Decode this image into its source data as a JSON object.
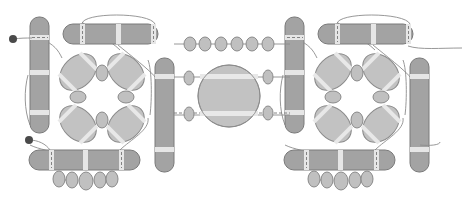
{
  "diagram": {
    "title": "",
    "colors": {
      "bar": "#a3a3a3",
      "band": "#e6e6e6",
      "lobe": "#c2c2c2",
      "bead": "#c0c0c0",
      "wire": "#8c8c8c",
      "terminal_dot": "#4a4a4a"
    },
    "modules": [
      {
        "name": "left-module",
        "side": "left"
      },
      {
        "name": "right-module",
        "side": "right"
      }
    ],
    "center": {
      "sphere": "central-sphere",
      "top_bead_chain_count": 6,
      "side_beads_count": 4
    },
    "bottom_bead_chain_count": 5,
    "terminal_dots": 2
  }
}
